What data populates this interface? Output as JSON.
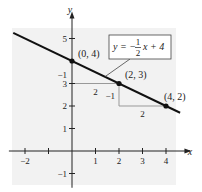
{
  "chart_data": {
    "type": "line",
    "title": "",
    "xlabel": "x",
    "ylabel": "y",
    "xlim": [
      -2.6,
      4.7
    ],
    "ylim": [
      -1.5,
      5.8
    ],
    "grid": false,
    "x_ticks": [
      -2,
      -1,
      1,
      2,
      3,
      4
    ],
    "x_tick_labels": [
      "−2",
      "",
      "1",
      "2",
      "3",
      "4"
    ],
    "y_ticks": [
      -1,
      1,
      2,
      3,
      5
    ],
    "y_tick_labels": [
      "−1",
      "1",
      "2",
      "3",
      "5"
    ],
    "series": [
      {
        "name": "y = -1/2 x + 4",
        "equation": {
          "slope": -0.5,
          "intercept": 4
        },
        "x_range": [
          -2.5,
          4.6
        ]
      }
    ],
    "points": [
      {
        "x": 0,
        "y": 4,
        "label": "(0, 4)"
      },
      {
        "x": 2,
        "y": 3,
        "label": "(2, 3)"
      },
      {
        "x": 4,
        "y": 2,
        "label": "(4, 2)"
      }
    ],
    "slope_triangles": [
      {
        "from": [
          0,
          4
        ],
        "corner": [
          2,
          3
        ],
        "run_label": "2",
        "rise_label": "−1",
        "corner_at": [
          0,
          3
        ]
      },
      {
        "from": [
          2,
          3
        ],
        "to": [
          4,
          2
        ],
        "run_label": "2",
        "rise_label": "−1",
        "corner_at": [
          2,
          2
        ]
      }
    ],
    "annotation": {
      "text_prefix": "y = −",
      "frac_num": "1",
      "frac_den": "2",
      "text_suffix": "x + 4",
      "points_to": [
        1.4,
        3.3
      ]
    }
  }
}
